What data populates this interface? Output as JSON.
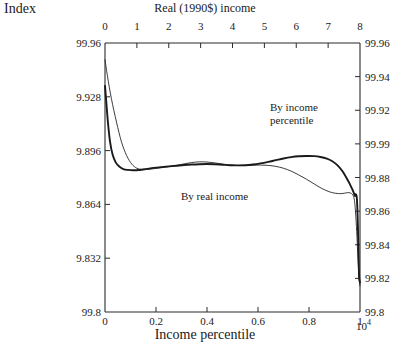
{
  "labels": {
    "index_label": "Index",
    "top_axis_title": "Real (1990$) income",
    "bottom_axis_title": "Income percentile",
    "exponent": "10",
    "exponent_sup": "4"
  },
  "annotations": {
    "income_percentile": [
      "By income",
      "percentile"
    ],
    "real_income": "By real income"
  },
  "chart_data": {
    "type": "line",
    "title": "",
    "xlabel": "Income percentile",
    "ylabel": "Index",
    "xlim": [
      0,
      1
    ],
    "ylim": [
      99.8,
      99.96
    ],
    "grid": false,
    "legend": "annotations-inline",
    "top_axis": {
      "label": "Real (1990$) income",
      "ticks": [
        0,
        1,
        2,
        3,
        4,
        5,
        6,
        7,
        8
      ],
      "tick_labels": [
        "0",
        "1",
        "2",
        "3",
        "4",
        "5",
        "6",
        "7",
        "8"
      ],
      "exponent_label": "10^4",
      "range": [
        0,
        8
      ]
    },
    "bottom_axis": {
      "ticks": [
        0,
        0.2,
        0.4,
        0.6,
        0.8,
        1
      ],
      "tick_labels": [
        "0",
        "0.2",
        "0.4",
        "0.6",
        "0.8",
        "1"
      ],
      "range": [
        0,
        1
      ]
    },
    "left_axis": {
      "ticks": [
        99.96,
        99.928,
        99.896,
        99.864,
        99.832,
        99.8
      ],
      "tick_labels": [
        "99.96",
        "9.928",
        "9.896",
        "9.864",
        "9.832",
        "99.8"
      ],
      "range": [
        99.8,
        99.96
      ]
    },
    "right_axis": {
      "ticks": [
        99.96,
        99.94,
        99.92,
        99.9,
        99.88,
        99.86,
        99.84,
        99.82,
        99.8
      ],
      "tick_labels": [
        "99.96",
        "99.94",
        "99.92",
        "99.99",
        "99.88",
        "99.86",
        "99.84",
        "99.82",
        "99.8"
      ],
      "range": [
        99.8,
        99.96
      ]
    },
    "series": [
      {
        "name": "By income percentile",
        "style": "thick",
        "x": [
          0.0,
          0.006,
          0.012,
          0.02,
          0.03,
          0.042,
          0.056,
          0.072,
          0.09,
          0.11,
          0.135,
          0.16,
          0.19,
          0.22,
          0.25,
          0.28,
          0.31,
          0.34,
          0.37,
          0.4,
          0.43,
          0.46,
          0.49,
          0.52,
          0.55,
          0.58,
          0.61,
          0.64,
          0.67,
          0.7,
          0.73,
          0.76,
          0.79,
          0.82,
          0.845,
          0.87,
          0.89,
          0.91,
          0.93,
          0.95,
          0.962,
          0.97,
          0.976,
          0.98,
          0.984,
          0.988,
          0.992,
          0.996,
          1.0
        ],
        "y": [
          99.9345,
          99.923,
          99.912,
          99.901,
          99.8935,
          99.889,
          99.8865,
          99.885,
          99.8845,
          99.8843,
          99.8845,
          99.885,
          99.8857,
          99.8862,
          99.8866,
          99.887,
          99.8874,
          99.8877,
          99.8879,
          99.888,
          99.8879,
          99.8876,
          99.8873,
          99.8872,
          99.8873,
          99.8877,
          99.8884,
          99.8893,
          99.8903,
          99.8913,
          99.8921,
          99.8926,
          99.8928,
          99.8927,
          99.8922,
          99.8912,
          99.8898,
          99.8875,
          99.884,
          99.879,
          99.8755,
          99.873,
          99.8707,
          99.869,
          99.87,
          99.867,
          99.85,
          99.823,
          99.8175
        ]
      },
      {
        "name": "By real income",
        "style": "thin",
        "x": [
          0.0,
          0.01,
          0.025,
          0.045,
          0.065,
          0.085,
          0.105,
          0.125,
          0.145,
          0.165,
          0.19,
          0.22,
          0.25,
          0.28,
          0.31,
          0.34,
          0.37,
          0.4,
          0.43,
          0.46,
          0.49,
          0.52,
          0.55,
          0.58,
          0.61,
          0.64,
          0.67,
          0.7,
          0.73,
          0.76,
          0.79,
          0.82,
          0.85,
          0.88,
          0.905,
          0.925,
          0.94,
          0.952,
          0.962,
          0.97,
          0.976,
          0.98,
          0.984,
          0.988,
          0.992,
          0.996,
          1.0
        ],
        "y": [
          99.95,
          99.94,
          99.927,
          99.913,
          99.901,
          99.893,
          99.888,
          99.8855,
          99.8848,
          99.8848,
          99.8852,
          99.8858,
          99.8864,
          99.8872,
          99.8881,
          99.8889,
          99.8893,
          99.8892,
          99.8887,
          99.888,
          99.8874,
          99.8871,
          99.8871,
          99.8873,
          99.8874,
          99.8872,
          99.8866,
          99.8855,
          99.8838,
          99.8815,
          99.879,
          99.8762,
          99.8735,
          99.8715,
          99.8706,
          99.8704,
          99.8707,
          99.871,
          99.8708,
          99.87,
          99.868,
          99.864,
          99.856,
          99.845,
          99.832,
          99.821,
          99.8155
        ]
      }
    ]
  }
}
